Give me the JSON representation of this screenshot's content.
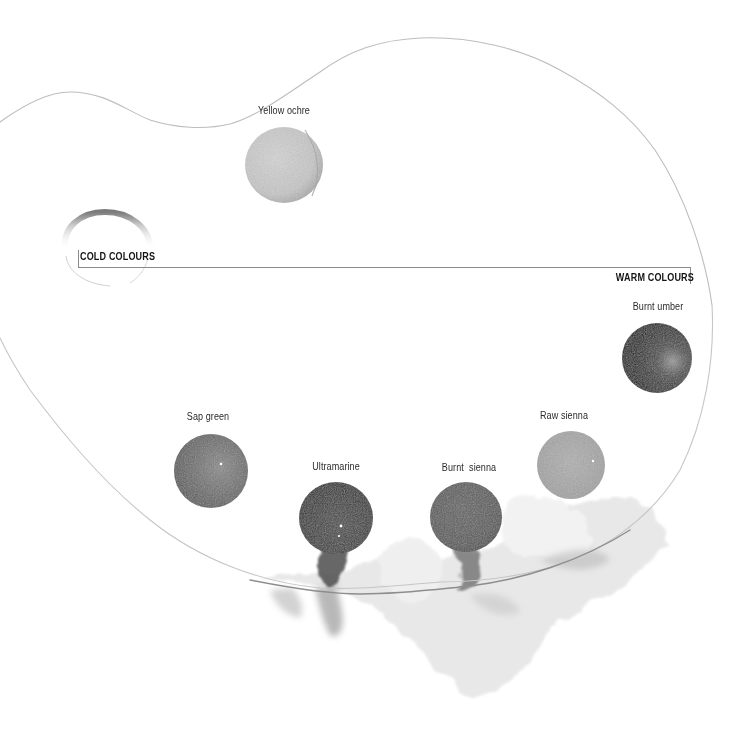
{
  "figure": {
    "background": "#ffffff"
  },
  "sections": {
    "cold": {
      "label": "COLD COLOURS"
    },
    "warm": {
      "label": "WARM COLOURS"
    }
  },
  "swatches": [
    {
      "name": "Yellow ochre",
      "tone": "#c9c9c9",
      "shade": "#a9a9a9",
      "cx": 284,
      "cy": 165,
      "r": 39
    },
    {
      "name": "Sap green",
      "tone": "#6c6c6c",
      "shade": "#555555",
      "cx": 211,
      "cy": 471,
      "r": 37
    },
    {
      "name": "Ultramarine",
      "tone": "#3e3e3e",
      "shade": "#262626",
      "cx": 336,
      "cy": 518,
      "r": 36
    },
    {
      "name": "Burnt  sienna",
      "tone": "#5e5e5e",
      "shade": "#454545",
      "cx": 466,
      "cy": 517,
      "r": 36
    },
    {
      "name": "Raw sienna",
      "tone": "#a6a6a6",
      "shade": "#8c8c8c",
      "cx": 571,
      "cy": 465,
      "r": 34
    },
    {
      "name": "Burnt umber",
      "tone": "#2c2c2c",
      "shade": "#161616",
      "cx": 657,
      "cy": 358,
      "r": 35
    }
  ]
}
